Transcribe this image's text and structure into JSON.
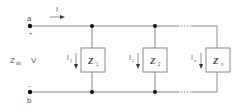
{
  "diagram": {
    "type": "parallel-impedance-circuit",
    "colors": {
      "wire": "#8a8a8a",
      "node": "#111111",
      "text": "#555555"
    },
    "terminals": {
      "a": {
        "label": "a",
        "polarity": "+"
      },
      "b": {
        "label": "b",
        "polarity": "−"
      }
    },
    "source": {
      "z_label": "Z",
      "z_sub": "ab",
      "v_label": "V"
    },
    "total_current": {
      "label": "I"
    },
    "branches": [
      {
        "z_label": "Z",
        "z_sub": "1",
        "i_label": "I",
        "i_sub": "1"
      },
      {
        "z_label": "Z",
        "z_sub": "2",
        "i_label": "I",
        "i_sub": "2"
      },
      {
        "z_label": "Z",
        "z_sub": "n",
        "i_label": "I",
        "i_sub": "n"
      }
    ],
    "ellipsis": "..."
  }
}
